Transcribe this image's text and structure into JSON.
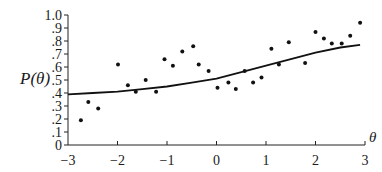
{
  "chart_data": {
    "type": "scatter",
    "title": "",
    "xlabel": "θ",
    "ylabel": "P(θ)",
    "xlim": [
      -3,
      3
    ],
    "ylim": [
      0,
      1.0
    ],
    "grid": false,
    "legend": null,
    "x_ticks": [
      "−3",
      "−2",
      "−1",
      "0",
      "1",
      "2",
      "3"
    ],
    "y_ticks": [
      "0",
      ".1",
      ".2",
      ".3",
      ".4",
      ".5",
      ".6",
      ".7",
      ".8",
      ".9",
      "1.0"
    ],
    "series": [
      {
        "name": "observed proportions",
        "type": "scatter",
        "points": [
          [
            -2.74,
            0.19
          ],
          [
            -2.59,
            0.33
          ],
          [
            -2.39,
            0.28
          ],
          [
            -1.99,
            0.62
          ],
          [
            -1.79,
            0.46
          ],
          [
            -1.63,
            0.41
          ],
          [
            -1.43,
            0.5
          ],
          [
            -1.22,
            0.41
          ],
          [
            -1.05,
            0.66
          ],
          [
            -0.88,
            0.61
          ],
          [
            -0.69,
            0.72
          ],
          [
            -0.47,
            0.76
          ],
          [
            -0.36,
            0.62
          ],
          [
            -0.16,
            0.57
          ],
          [
            0.02,
            0.44
          ],
          [
            0.24,
            0.48
          ],
          [
            0.39,
            0.43
          ],
          [
            0.57,
            0.57
          ],
          [
            0.74,
            0.48
          ],
          [
            0.91,
            0.52
          ],
          [
            1.11,
            0.74
          ],
          [
            1.26,
            0.62
          ],
          [
            1.46,
            0.79
          ],
          [
            1.79,
            0.63
          ],
          [
            2.0,
            0.87
          ],
          [
            2.17,
            0.82
          ],
          [
            2.33,
            0.78
          ],
          [
            2.53,
            0.78
          ],
          [
            2.7,
            0.84
          ],
          [
            2.9,
            0.94
          ]
        ]
      },
      {
        "name": "item characteristic curve",
        "type": "line",
        "points": [
          [
            -3.0,
            0.39
          ],
          [
            -2.5,
            0.4
          ],
          [
            -2.0,
            0.41
          ],
          [
            -1.5,
            0.43
          ],
          [
            -1.0,
            0.45
          ],
          [
            -0.5,
            0.48
          ],
          [
            0.0,
            0.51
          ],
          [
            0.5,
            0.56
          ],
          [
            1.0,
            0.61
          ],
          [
            1.5,
            0.66
          ],
          [
            2.0,
            0.71
          ],
          [
            2.5,
            0.75
          ],
          [
            2.9,
            0.77
          ]
        ]
      }
    ]
  }
}
